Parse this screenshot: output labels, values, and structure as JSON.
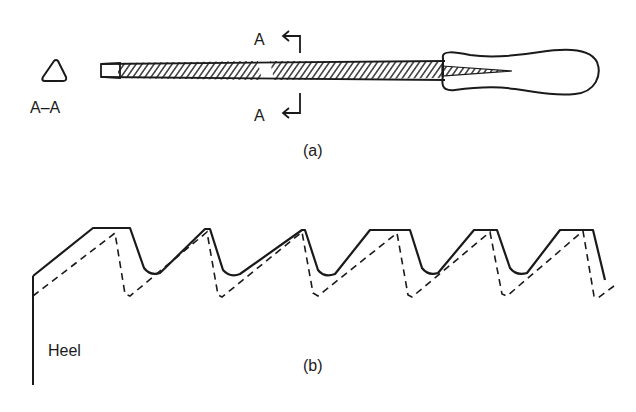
{
  "figure": {
    "part_a": {
      "caption": "(a)",
      "section_label": "A–A",
      "section_shape": "triangle",
      "cut_marker_top": "A",
      "cut_marker_bottom": "A",
      "components": [
        "section-view",
        "file-tang-tip",
        "file-blade",
        "file-handle"
      ]
    },
    "part_b": {
      "caption": "(b)",
      "heel_label": "Heel",
      "profiles": [
        {
          "name": "new-tooth-profile",
          "style": "solid"
        },
        {
          "name": "worn-tooth-profile",
          "style": "dashed"
        }
      ],
      "tooth_count": 6
    }
  },
  "colors": {
    "ink": "#1a1a1a",
    "background": "#ffffff"
  }
}
